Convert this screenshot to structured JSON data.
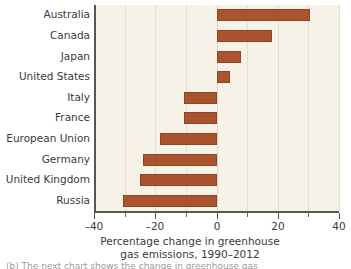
{
  "chart_data": {
    "type": "bar",
    "orientation": "horizontal",
    "title": "",
    "xlabel": "Percentage change in greenhouse gas emissions, 1990–2012",
    "ylabel": "",
    "xlim": [
      -40,
      40
    ],
    "grid": true,
    "legend": "none",
    "bar_color": "#a9542f",
    "plot_background": "#f7f2e7",
    "categories": [
      "Australia",
      "Canada",
      "Japan",
      "United States",
      "Italy",
      "France",
      "European Union",
      "Germany",
      "United Kingdom",
      "Russia"
    ],
    "values": [
      30.5,
      18.0,
      8.0,
      4.5,
      -10.5,
      -10.5,
      -18.5,
      -24.0,
      -25.0,
      -30.5
    ],
    "xticks": [
      -40,
      -20,
      0,
      20,
      40
    ],
    "xticklabels": [
      "–40",
      "–20",
      "0",
      "20",
      "40"
    ],
    "xminorticks": [
      -30,
      -10,
      10,
      30
    ]
  },
  "axis": {
    "title_line1": "Percentage change in greenhouse",
    "title_line2": "gas emissions, 1990–2012"
  },
  "caption": {
    "sliver_text": "(b) The next chart shows the change in greenhouse gas"
  }
}
